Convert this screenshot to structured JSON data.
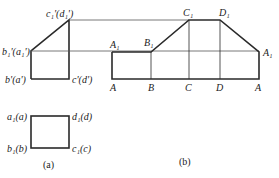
{
  "figure_a": {
    "caption": "(a)",
    "top_view": {
      "labels": {
        "c1d1": "c₁'(d₁')",
        "b1a1": "b₁'(a₁')",
        "ba": "b'(a')",
        "cd": "c'(d')"
      }
    },
    "bottom_view": {
      "labels": {
        "a1a": "a₁(a)",
        "d1d": "d₁(d)",
        "b1b": "b₁(b)",
        "c1c": "c₁(c)"
      }
    }
  },
  "figure_b": {
    "caption": "(b)",
    "top_labels": [
      "A₁",
      "B₁",
      "C₁",
      "D₁",
      "A₁"
    ],
    "bottom_labels": [
      "A",
      "B",
      "C",
      "D",
      "A"
    ]
  },
  "colors": {
    "line": "#2a2a2a",
    "thin_line": "#555555"
  }
}
